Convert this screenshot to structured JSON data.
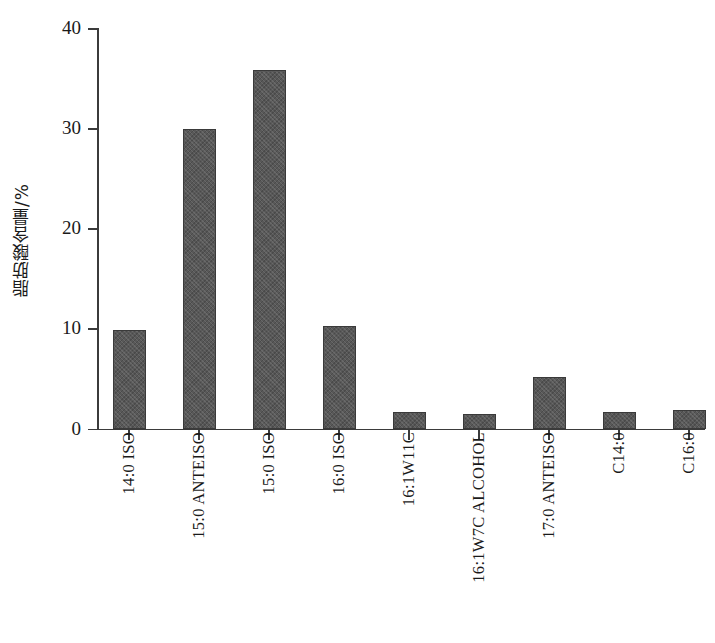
{
  "chart_data": {
    "type": "bar",
    "title": "",
    "xlabel": "",
    "ylabel": "脂肪酸含量/%",
    "ylim": [
      0,
      40
    ],
    "yticks": [
      0,
      10,
      20,
      30,
      40
    ],
    "grid": false,
    "legend": null,
    "categories": [
      "14:0 ISO",
      "15:0 ANTEISO",
      "15:0 ISO",
      "16:0 ISO",
      "16:1W11C",
      "16:1W7C ALCOHOL",
      "17:0 ANTEISO",
      "C14:0",
      "C16:0"
    ],
    "values": [
      9.8,
      29.9,
      35.8,
      10.2,
      1.7,
      1.5,
      5.1,
      1.7,
      1.9
    ],
    "series": [
      {
        "name": "脂肪酸含量",
        "values": [
          9.8,
          29.9,
          35.8,
          10.2,
          1.7,
          1.5,
          5.1,
          1.7,
          1.9
        ]
      }
    ],
    "bar_color": "#585858",
    "axis_color": "#3b3b3b",
    "background": "#ffffff"
  }
}
